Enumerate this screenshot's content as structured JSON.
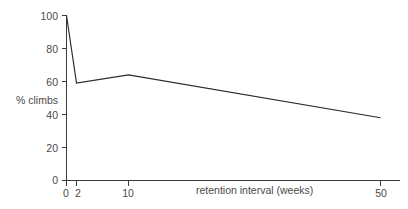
{
  "chart_data": {
    "type": "line",
    "title": "",
    "xlabel": "retention interval (weeks)",
    "ylabel": "% climbs",
    "x": [
      0,
      2,
      10,
      50
    ],
    "values": [
      100,
      59,
      64,
      38
    ],
    "xtick_labels": [
      "0",
      "2",
      "10",
      "50"
    ],
    "ytick_labels": [
      "0",
      "20",
      "40",
      "60",
      "80",
      "100"
    ],
    "ytick_values": [
      0,
      20,
      40,
      60,
      80,
      100
    ],
    "ylim": [
      0,
      100
    ],
    "grid": false,
    "legend": "none",
    "line_color": "#2a2a2a",
    "axis_color": "#3a3a3a",
    "background_color": "#ffffff"
  },
  "axis": {
    "y_label": "% climbs",
    "x_label": "retention interval (weeks)",
    "y_ticks": [
      {
        "label": "100",
        "value": 100
      },
      {
        "label": "80",
        "value": 80
      },
      {
        "label": "60",
        "value": 60
      },
      {
        "label": "40",
        "value": 40
      },
      {
        "label": "20",
        "value": 20
      },
      {
        "label": "0",
        "value": 0
      }
    ],
    "x_ticks": [
      {
        "label": "0",
        "value": 0
      },
      {
        "label": "2",
        "value": 2
      },
      {
        "label": "10",
        "value": 10
      },
      {
        "label": "50",
        "value": 50
      }
    ]
  }
}
